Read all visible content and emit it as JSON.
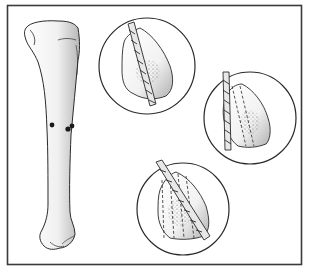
{
  "figure": {
    "frame_color": "#3a3a3a",
    "line_color": "#2a2a2a",
    "bone_fill": "#f2f2f2",
    "shade_color": "#bdbdbd",
    "marker_color": "#1a1a1a",
    "insets": [
      {
        "id": "inset-1",
        "label": "single drill pass",
        "dashed_paths": 0
      },
      {
        "id": "inset-2",
        "label": "second drill pass",
        "dashed_paths": 1
      },
      {
        "id": "inset-3",
        "label": "multiple drill passes",
        "dashed_paths": 3
      }
    ],
    "bone_markers": 3
  }
}
